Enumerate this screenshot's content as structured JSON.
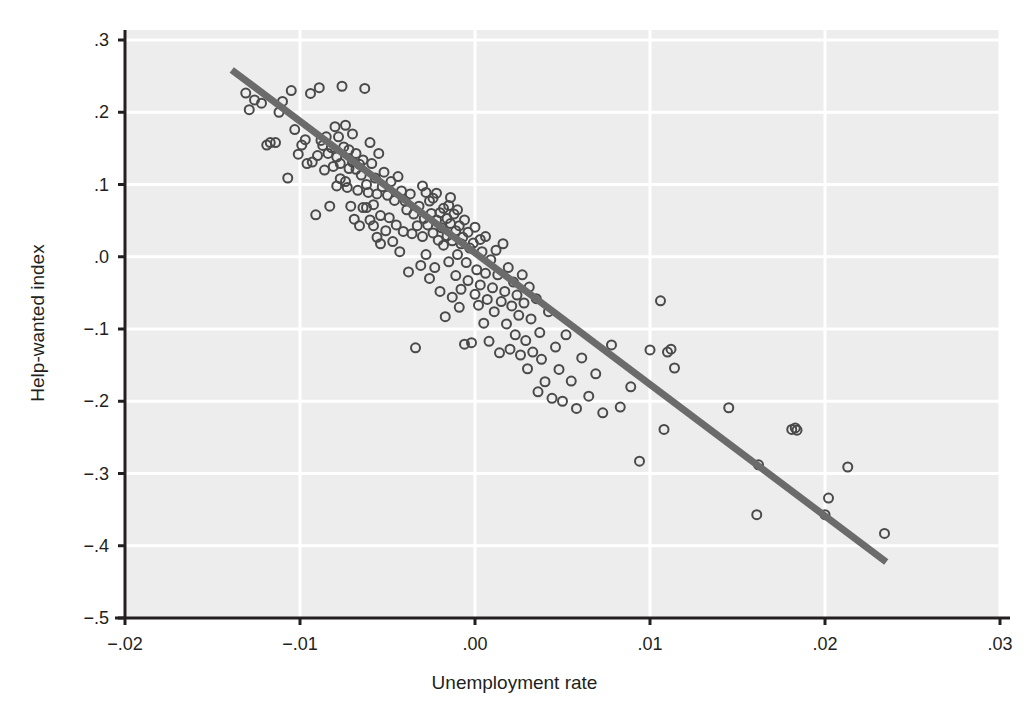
{
  "chart_data": {
    "type": "scatter",
    "title": "",
    "xlabel": "Unemployment rate",
    "ylabel": "Help-wanted index",
    "xlim": [
      -0.02,
      0.03
    ],
    "ylim": [
      -0.5,
      0.3
    ],
    "xticks": [
      -0.02,
      -0.01,
      0.0,
      0.01,
      0.02,
      0.03
    ],
    "xticklabels": [
      "−.02",
      "−.01",
      ".00",
      ".01",
      ".02",
      ".03"
    ],
    "yticks": [
      0.3,
      0.2,
      0.1,
      0.0,
      -0.1,
      -0.2,
      -0.3,
      -0.4,
      -0.5
    ],
    "yticklabels": [
      ".3",
      ".2",
      ".1",
      ".0",
      "−.1",
      "−.2",
      "−.3",
      "−.4",
      "−.5"
    ],
    "grid": true,
    "grid_color": "#ffffff",
    "panel_background": "#ededed",
    "marker": {
      "style": "open-circle",
      "edge_color": "#4a4a4a",
      "face_color": "none",
      "size_px": 11,
      "stroke_px": 2
    },
    "fit_line": {
      "label": "regression line",
      "color": "#6b6b6b",
      "width_px": 7,
      "x_start": -0.0139,
      "y_start": 0.2585,
      "x_end": 0.0235,
      "y_end": -0.4225,
      "slope": -18.21,
      "intercept": 0.0055
    },
    "legend": null,
    "n_points": 203,
    "x": [
      -0.0131,
      -0.0129,
      -0.0126,
      -0.0122,
      -0.0119,
      -0.0117,
      -0.0114,
      -0.0112,
      -0.011,
      -0.0107,
      -0.0105,
      -0.0103,
      -0.0101,
      -0.0099,
      -0.0097,
      -0.0096,
      -0.0094,
      -0.0093,
      -0.0091,
      -0.009,
      -0.0089,
      -0.0088,
      -0.0087,
      -0.0086,
      -0.0085,
      -0.0084,
      -0.0083,
      -0.0082,
      -0.0081,
      -0.008,
      -0.0079,
      -0.0079,
      -0.0078,
      -0.0077,
      -0.0077,
      -0.0076,
      -0.0075,
      -0.0074,
      -0.0074,
      -0.0073,
      -0.0072,
      -0.0072,
      -0.0071,
      -0.007,
      -0.007,
      -0.0069,
      -0.0068,
      -0.0068,
      -0.0067,
      -0.0066,
      -0.0066,
      -0.0065,
      -0.0064,
      -0.0064,
      -0.0063,
      -0.0062,
      -0.0062,
      -0.0061,
      -0.006,
      -0.006,
      -0.0059,
      -0.0058,
      -0.0058,
      -0.0057,
      -0.0056,
      -0.0056,
      -0.0055,
      -0.0054,
      -0.0054,
      -0.0053,
      -0.0052,
      -0.0051,
      -0.005,
      -0.0049,
      -0.0048,
      -0.0047,
      -0.0046,
      -0.0045,
      -0.0044,
      -0.0043,
      -0.0042,
      -0.0041,
      -0.004,
      -0.0039,
      -0.0038,
      -0.0037,
      -0.0036,
      -0.0035,
      -0.0034,
      -0.0033,
      -0.0032,
      -0.0031,
      -0.003,
      -0.003,
      -0.0029,
      -0.0028,
      -0.0028,
      -0.0027,
      -0.0026,
      -0.0026,
      -0.0025,
      -0.0024,
      -0.0024,
      -0.0023,
      -0.0022,
      -0.0022,
      -0.0021,
      -0.002,
      -0.002,
      -0.0019,
      -0.0018,
      -0.0018,
      -0.0017,
      -0.0016,
      -0.0016,
      -0.0015,
      -0.0015,
      -0.0014,
      -0.0014,
      -0.0013,
      -0.0013,
      -0.0012,
      -0.0011,
      -0.0011,
      -0.001,
      -0.001,
      -0.0009,
      -0.0009,
      -0.0008,
      -0.0008,
      -0.0007,
      -0.0006,
      -0.0006,
      -0.0005,
      -0.0004,
      -0.0004,
      -0.0003,
      -0.0002,
      -0.0001,
      0.0,
      0.0,
      0.0001,
      0.0002,
      0.0003,
      0.0003,
      0.0004,
      0.0005,
      0.0006,
      0.0006,
      0.0007,
      0.0008,
      0.0009,
      0.001,
      0.0011,
      0.0012,
      0.0013,
      0.0014,
      0.0015,
      0.0016,
      0.0017,
      0.0018,
      0.0019,
      0.002,
      0.0021,
      0.0022,
      0.0023,
      0.0024,
      0.0025,
      0.0026,
      0.0027,
      0.0028,
      0.0029,
      0.003,
      0.0031,
      0.0032,
      0.0033,
      0.0035,
      0.0036,
      0.0037,
      0.0038,
      0.004,
      0.0042,
      0.0044,
      0.0046,
      0.0048,
      0.005,
      0.0052,
      0.0055,
      0.0058,
      0.0061,
      0.0065,
      0.0069,
      0.0073,
      0.0078,
      0.0083,
      0.0089,
      0.0094,
      0.01,
      0.0106,
      0.0108,
      0.011,
      0.0112,
      0.0114,
      0.0145,
      0.0161,
      0.0162,
      0.0181,
      0.0183,
      0.0184,
      0.02,
      0.0202,
      0.0213,
      0.0234
    ],
    "y": [
      0.2265,
      0.2035,
      0.217,
      0.2125,
      0.1545,
      0.158,
      0.158,
      0.2,
      0.215,
      0.109,
      0.23,
      0.176,
      0.142,
      0.1545,
      0.162,
      0.129,
      0.226,
      0.131,
      0.058,
      0.14,
      0.234,
      0.161,
      0.154,
      0.12,
      0.166,
      0.143,
      0.07,
      0.151,
      0.125,
      0.18,
      0.138,
      0.098,
      0.166,
      0.129,
      0.108,
      0.236,
      0.152,
      0.104,
      0.182,
      0.096,
      0.122,
      0.148,
      0.07,
      0.131,
      0.17,
      0.052,
      0.121,
      0.143,
      0.092,
      0.128,
      0.043,
      0.113,
      0.134,
      0.068,
      0.233,
      0.1,
      0.068,
      0.089,
      0.158,
      0.051,
      0.129,
      0.072,
      0.043,
      0.109,
      0.087,
      0.027,
      0.143,
      0.057,
      0.018,
      0.097,
      0.117,
      0.036,
      0.085,
      0.054,
      0.104,
      0.021,
      0.078,
      0.044,
      0.111,
      0.007,
      0.091,
      0.035,
      0.077,
      0.065,
      -0.021,
      0.087,
      0.032,
      0.059,
      -0.126,
      0.043,
      0.07,
      -0.012,
      0.098,
      0.028,
      0.053,
      0.089,
      0.003,
      0.044,
      0.077,
      -0.03,
      0.06,
      0.033,
      0.081,
      -0.015,
      0.051,
      0.088,
      0.023,
      0.061,
      -0.048,
      0.04,
      0.067,
      0.016,
      -0.083,
      0.053,
      0.029,
      0.071,
      -0.007,
      0.046,
      0.082,
      -0.056,
      0.022,
      0.059,
      -0.026,
      0.036,
      0.065,
      0.003,
      -0.07,
      0.043,
      0.018,
      -0.045,
      0.027,
      -0.121,
      0.051,
      -0.008,
      0.034,
      -0.033,
      0.012,
      -0.119,
      0.019,
      -0.052,
      0.041,
      -0.018,
      -0.067,
      0.024,
      -0.039,
      0.007,
      -0.092,
      -0.023,
      0.028,
      -0.059,
      -0.117,
      -0.004,
      -0.043,
      -0.076,
      0.009,
      -0.025,
      -0.133,
      -0.062,
      0.018,
      -0.048,
      -0.093,
      -0.015,
      -0.128,
      -0.068,
      -0.035,
      -0.108,
      -0.053,
      -0.081,
      -0.136,
      -0.025,
      -0.064,
      -0.116,
      -0.155,
      -0.042,
      -0.086,
      -0.132,
      -0.058,
      -0.187,
      -0.105,
      -0.142,
      -0.173,
      -0.076,
      -0.196,
      -0.125,
      -0.156,
      -0.2,
      -0.108,
      -0.172,
      -0.21,
      -0.14,
      -0.193,
      -0.162,
      -0.216,
      -0.122,
      -0.208,
      -0.18,
      -0.283,
      -0.129,
      -0.061,
      -0.239,
      -0.132,
      -0.128,
      -0.154,
      -0.209,
      -0.357,
      -0.288,
      -0.239,
      -0.237,
      -0.24,
      -0.357,
      -0.334,
      -0.291,
      -0.383
    ]
  },
  "figure": {
    "background": "#ffffff",
    "axis_color": "#231f20",
    "tick_length_px": 7
  }
}
